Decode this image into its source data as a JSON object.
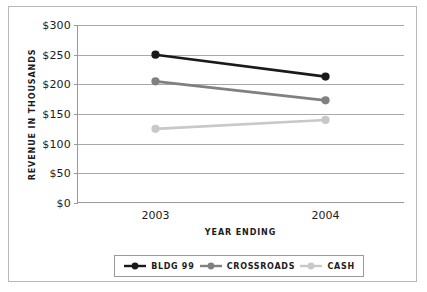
{
  "chart_data": {
    "type": "line",
    "title": "",
    "xlabel": "YEAR ENDING",
    "ylabel": "REVENUE IN THOUSANDS",
    "categories": [
      "2003",
      "2004"
    ],
    "ylim": [
      0,
      300
    ],
    "ytick_step": 50,
    "ytick_labels": [
      "$300",
      "$250",
      "$200",
      "$150",
      "$100",
      "$50",
      "$0"
    ],
    "ytick_values": [
      300,
      250,
      200,
      150,
      100,
      50,
      0
    ],
    "grid": "horizontal",
    "legend_position": "bottom",
    "series": [
      {
        "name": "BLDG 99",
        "values": [
          250,
          213
        ],
        "color": "#1a1a1a"
      },
      {
        "name": "CROSSROADS",
        "values": [
          205,
          173
        ],
        "color": "#808080"
      },
      {
        "name": "CASH",
        "values": [
          125,
          140
        ],
        "color": "#c8c8c8"
      }
    ]
  }
}
